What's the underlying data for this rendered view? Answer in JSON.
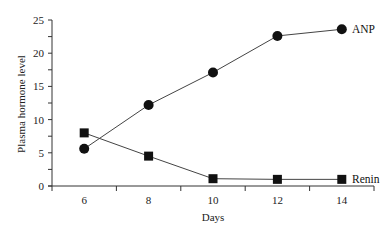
{
  "chart_data": {
    "type": "line",
    "title": "",
    "xlabel": "Days",
    "ylabel": "Plasma hormone level",
    "x": [
      6,
      8,
      10,
      12,
      14
    ],
    "x_tick_labels": [
      "6",
      "8",
      "10",
      "12",
      "14"
    ],
    "y_tick_labels": [
      "0",
      "5",
      "10",
      "15",
      "20",
      "25"
    ],
    "ylim": [
      0,
      25
    ],
    "xlim": [
      5,
      15
    ],
    "grid": false,
    "legend": "inline labels at line ends",
    "series": [
      {
        "name": "ANP",
        "marker": "circle",
        "values": [
          5.6,
          12.2,
          17.1,
          22.6,
          23.6
        ]
      },
      {
        "name": "Renin",
        "marker": "square",
        "values": [
          8.0,
          4.5,
          1.1,
          1.0,
          1.0
        ]
      }
    ]
  },
  "labels": {
    "xlabel": "Days",
    "ylabel": "Plasma hormone level",
    "anp": "ANP",
    "renin": "Renin"
  }
}
